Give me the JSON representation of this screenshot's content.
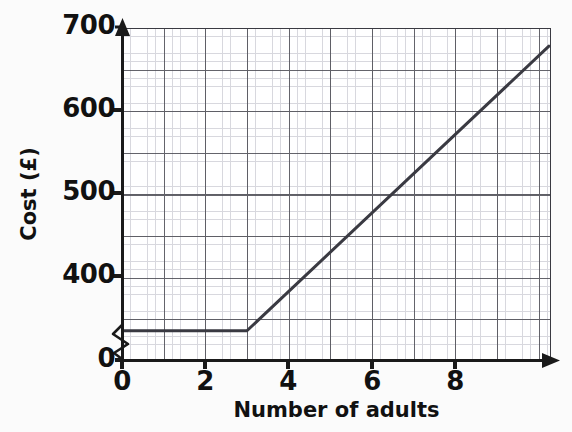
{
  "chart_data": {
    "type": "line",
    "title": "",
    "xlabel": "Number of adults",
    "ylabel": "Cost (£)",
    "xlim": [
      0,
      10.3
    ],
    "ylim": [
      370,
      700
    ],
    "y_axis_broken": true,
    "y_break_label": "0",
    "grid": "major and minor",
    "legend": "none",
    "x_ticks": [
      "0",
      "2",
      "4",
      "6",
      "8"
    ],
    "x_tick_values": [
      0,
      2,
      4,
      6,
      8
    ],
    "y_ticks": [
      "0",
      "400",
      "500",
      "600",
      "700"
    ],
    "y_tick_values": [
      0,
      400,
      500,
      600,
      700
    ],
    "x_major_step": 1,
    "y_major_step": 50,
    "x_minor_per_major": 5,
    "y_minor_per_major": 5,
    "series": [
      {
        "name": "Cost",
        "points": [
          {
            "x": 0,
            "y": 400
          },
          {
            "x": 3,
            "y": 400
          },
          {
            "x": 10.25,
            "y": 682
          }
        ],
        "color": "#3a3a42",
        "description": "Flat at £400 for 0 to 3 adults, then rises linearly at about £40 per extra adult"
      }
    ]
  },
  "figure": {
    "line_color": "#3a3a42",
    "grid_major_color": "#4a4a52",
    "grid_minor_color": "#b9b9c4",
    "axis_color": "#1a1a1a",
    "background": "#ffffff"
  }
}
